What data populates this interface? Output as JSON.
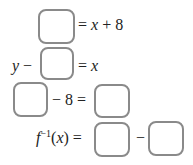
{
  "equations": [
    {
      "id": "eq1",
      "parts": {
        "rhs": "= ",
        "var": "x",
        "tail": " + 8"
      }
    },
    {
      "id": "eq2",
      "parts": {
        "lhs_var": "y",
        "lhs_op": " − ",
        "rhs": "= ",
        "var": "x"
      }
    },
    {
      "id": "eq3",
      "parts": {
        "op": "− 8 ="
      }
    },
    {
      "id": "eq4",
      "parts": {
        "f": "f",
        "sup": "−1",
        "arg_open": "(",
        "arg": "x",
        "arg_close": ")",
        "eq": " =",
        "minus": "−"
      }
    }
  ],
  "answer_boxes": [
    {
      "id": "box1",
      "value": ""
    },
    {
      "id": "box2",
      "value": ""
    },
    {
      "id": "box3",
      "value": ""
    },
    {
      "id": "box4",
      "value": ""
    },
    {
      "id": "box5",
      "value": ""
    },
    {
      "id": "box6",
      "value": ""
    }
  ]
}
